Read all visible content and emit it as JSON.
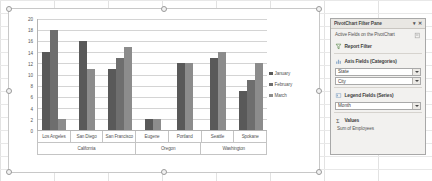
{
  "chart_data": {
    "type": "bar",
    "title": "",
    "subtitle": "",
    "xlabel": "",
    "ylabel": "",
    "ylim": [
      0,
      20
    ],
    "yticks": [
      20,
      18,
      16,
      14,
      12,
      10,
      8,
      6,
      4,
      2,
      0
    ],
    "grid": true,
    "legend_position": "right",
    "legend": [
      "January",
      "February",
      "March"
    ],
    "categories": [
      "Los Angeles",
      "San Diego",
      "San Francisco",
      "Eugene",
      "Portland",
      "Seattle",
      "Spokane"
    ],
    "category_groups": [
      {
        "label": "California",
        "span": 3
      },
      {
        "label": "Oregon",
        "span": 2
      },
      {
        "label": "Washington",
        "span": 2
      }
    ],
    "series": [
      {
        "name": "January",
        "color": "#595959",
        "values": [
          14,
          16,
          11,
          2,
          12,
          13,
          7
        ]
      },
      {
        "name": "February",
        "color": "#6e6e6e",
        "values": [
          18,
          null,
          13,
          null,
          null,
          null,
          9
        ]
      },
      {
        "name": "March",
        "color": "#8c8c8c",
        "values": [
          2,
          11,
          15,
          2,
          12,
          14,
          12
        ]
      }
    ]
  },
  "filter_pane": {
    "title": "PivotChart Filter Pane",
    "minimize_glyph": "▾",
    "close_glyph": "✕",
    "subtitle": "Active Fields on the PivotChart",
    "sections": [
      {
        "key": "report_filter",
        "icon": "funnel-icon",
        "label": "Report Filter",
        "fields": []
      },
      {
        "key": "axis_fields",
        "icon": "axis-fields-icon",
        "label": "Axis Fields (Categories)",
        "fields": [
          "State",
          "City"
        ]
      },
      {
        "key": "legend_fields",
        "icon": "legend-fields-icon",
        "label": "Legend Fields (Series)",
        "fields": [
          "Month"
        ]
      },
      {
        "key": "values",
        "icon": "sigma-icon",
        "label": "Values",
        "fields": []
      }
    ],
    "values_item": "Sum of Employees"
  }
}
